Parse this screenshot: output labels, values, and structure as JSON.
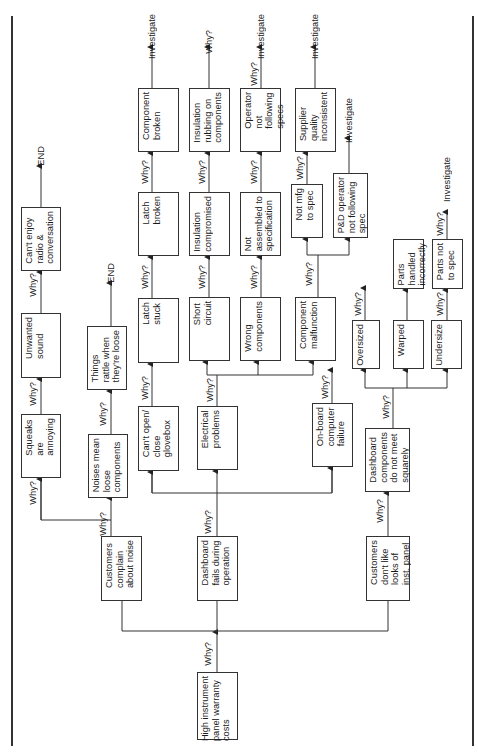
{
  "diagram": {
    "type": "five-whys tree",
    "orientation": "rotated 90 degrees counter-clockwise (root at bottom, text reads bottom-to-top)",
    "root": {
      "id": "root",
      "label": "High instrument\npanel warranty\ncosts"
    },
    "why_label": "Why?",
    "terminal_labels": {
      "end": "END",
      "investigate": "Investigate",
      "why": "Why?"
    },
    "nodes": {
      "n_noise": "Customers\ncomplain\nabout noise",
      "n_fails": "Dashboard\nfails during\noperation",
      "n_looks": "Customers\ndon't like\nlooks of\ninst. panel",
      "n_squeaks": "Squeaks\nare\nannoying",
      "n_unwanted": "Unwanted\nsound",
      "n_radio": "Can't enjoy\nradio &\nconversation",
      "n_noises_mean": "Noises mean\nloose\ncomponents",
      "n_rattle": "Things\nrattle when\nthey're loose",
      "n_glovebox": "Can't open/\nclose\nglovebox",
      "n_latch_stuck": "Latch\nstuck",
      "n_latch_broken": "Latch\nbroken",
      "n_comp_broken": "Component\nbroken",
      "n_electrical": "Electrical\nproblems",
      "n_short": "Short\ncircuit",
      "n_ins_comp": "Insulation\ncompromised",
      "n_ins_rub": "Insulation\nrubbing on\ncomponents",
      "n_wrong": "Wrong\ncomponents",
      "n_not_assembled": "Not\nassembled to\nspecification",
      "n_operator": "Operator\nnot\nfollowing\nspecs",
      "n_malfunction": "Component\nmalfunction",
      "n_not_mfg": "Not mfg\nto spec",
      "n_supplier": "Supplier\nquality\ninconsistent",
      "n_pd": "P&D operator\nnot following\nspec",
      "n_onboard": "On-board\ncomputer\nfailure",
      "n_dash_comp": "Dashboard\ncomponents\ndo not meet\nsquarely",
      "n_oversized": "Oversized",
      "n_warped": "Warped",
      "n_handled": "Parts\nhandled\nincorrectly",
      "n_undersize": "Undersize",
      "n_parts_not": "Parts not\nto spec"
    },
    "edges": [
      [
        "root",
        "n_noise"
      ],
      [
        "root",
        "n_fails"
      ],
      [
        "root",
        "n_looks"
      ],
      [
        "n_noise",
        "n_squeaks"
      ],
      [
        "n_noise",
        "n_noises_mean"
      ],
      [
        "n_squeaks",
        "n_unwanted"
      ],
      [
        "n_unwanted",
        "n_radio"
      ],
      [
        "n_radio",
        "END"
      ],
      [
        "n_noises_mean",
        "n_rattle"
      ],
      [
        "n_rattle",
        "END"
      ],
      [
        "n_fails",
        "n_glovebox"
      ],
      [
        "n_fails",
        "n_electrical"
      ],
      [
        "n_fails",
        "n_onboard"
      ],
      [
        "n_glovebox",
        "n_latch_stuck"
      ],
      [
        "n_latch_stuck",
        "n_latch_broken"
      ],
      [
        "n_latch_broken",
        "n_comp_broken"
      ],
      [
        "n_comp_broken",
        "Investigate"
      ],
      [
        "n_electrical",
        "n_short"
      ],
      [
        "n_electrical",
        "n_wrong"
      ],
      [
        "n_electrical",
        "n_malfunction"
      ],
      [
        "n_short",
        "n_ins_comp"
      ],
      [
        "n_ins_comp",
        "n_ins_rub"
      ],
      [
        "n_ins_rub",
        "Why?"
      ],
      [
        "n_wrong",
        "n_not_assembled"
      ],
      [
        "n_not_assembled",
        "n_operator"
      ],
      [
        "n_operator",
        "Investigate"
      ],
      [
        "n_malfunction",
        "n_not_mfg"
      ],
      [
        "n_malfunction",
        "n_pd"
      ],
      [
        "n_not_mfg",
        "n_supplier"
      ],
      [
        "n_supplier",
        "Investigate"
      ],
      [
        "n_pd",
        "Investigate"
      ],
      [
        "n_onboard",
        "(open arrow)"
      ],
      [
        "n_looks",
        "n_dash_comp"
      ],
      [
        "n_dash_comp",
        "n_oversized"
      ],
      [
        "n_dash_comp",
        "n_warped"
      ],
      [
        "n_dash_comp",
        "n_undersize"
      ],
      [
        "n_oversized",
        "(open arrow)"
      ],
      [
        "n_warped",
        "n_handled"
      ],
      [
        "n_undersize",
        "n_parts_not"
      ],
      [
        "n_parts_not",
        "Investigate"
      ]
    ]
  }
}
